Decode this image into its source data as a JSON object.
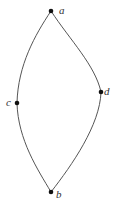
{
  "diagram": {
    "type": "graph",
    "nodes": [
      {
        "id": "a",
        "label": "a"
      },
      {
        "id": "b",
        "label": "b"
      },
      {
        "id": "c",
        "label": "c"
      },
      {
        "id": "d",
        "label": "d"
      }
    ],
    "edges": [
      {
        "from": "a",
        "to": "c"
      },
      {
        "from": "c",
        "to": "b"
      },
      {
        "from": "a",
        "to": "d"
      },
      {
        "from": "d",
        "to": "b"
      }
    ],
    "colors": {
      "edge": "#555555",
      "node": "#111111",
      "label": "#333333"
    }
  }
}
